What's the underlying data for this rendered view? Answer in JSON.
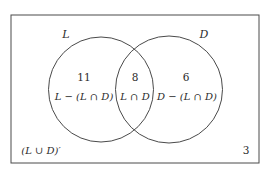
{
  "diagram": {
    "type": "venn",
    "universe": {
      "complement_label": "(L ∪ D)′",
      "complement_count": "3"
    },
    "sets": [
      {
        "name": "L",
        "label": "L"
      },
      {
        "name": "D",
        "label": "D"
      }
    ],
    "regions": {
      "left_only": {
        "count": "11",
        "label": "L − (L ∩ D)"
      },
      "intersection": {
        "count": "8",
        "label": "L ∩ D"
      },
      "right_only": {
        "count": "6",
        "label": "D − (L ∩ D)"
      }
    },
    "colors": {
      "stroke": "#4a4a4a",
      "text": "#2b2b2b",
      "background": "#ffffff"
    }
  }
}
